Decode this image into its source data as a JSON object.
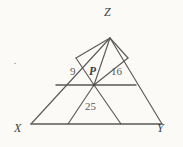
{
  "figure": {
    "kind": "geometry-diagram",
    "shape": "triangle",
    "background_color": "#fbfaf7",
    "stroke_color": "#5c5a57",
    "triangle": {
      "name": "XYZ",
      "vertices": [
        {
          "id": "Z",
          "label": "Z",
          "x": 110,
          "y": 38
        },
        {
          "id": "X",
          "label": "X",
          "x": 31,
          "y": 124
        },
        {
          "id": "Y",
          "label": "Y",
          "x": 162,
          "y": 124
        }
      ]
    },
    "interior_point": {
      "id": "P",
      "label": "P",
      "x": 94,
      "y": 85
    },
    "regions": [
      {
        "id": "left-region",
        "label": "9",
        "value": 9,
        "x": 74,
        "y": 72
      },
      {
        "id": "right-region",
        "label": "16",
        "value": 16,
        "x": 117,
        "y": 72
      },
      {
        "id": "bottom-region",
        "label": "25",
        "value": 25,
        "x": 92,
        "y": 108
      }
    ],
    "vertex_label_positions": [
      {
        "id": "Z-label",
        "label": "Z",
        "x": 106,
        "y": 12
      },
      {
        "id": "X-label",
        "label": "X",
        "x": 18,
        "y": 128
      },
      {
        "id": "Y-label",
        "label": "Y",
        "x": 160,
        "y": 128
      }
    ],
    "segments": [
      {
        "id": "side-XZ",
        "from": "X",
        "to": "Z"
      },
      {
        "id": "side-ZY",
        "from": "Z",
        "to": "Y"
      },
      {
        "id": "side-XY",
        "from": "X",
        "to": "Y"
      },
      {
        "id": "midline-through-P",
        "from": "edge-XZ",
        "to": "edge-ZY"
      },
      {
        "id": "cevian-P-to-Z",
        "from": "P",
        "to": "Z"
      },
      {
        "id": "left-parallel-P",
        "from": "P",
        "to": "edge-XZ"
      },
      {
        "id": "right-parallel-P",
        "from": "P",
        "to": "edge-ZY"
      },
      {
        "id": "lower-left-P",
        "from": "P",
        "to": "edge-XY"
      },
      {
        "id": "lower-right-P",
        "from": "P",
        "to": "edge-XY"
      }
    ]
  }
}
